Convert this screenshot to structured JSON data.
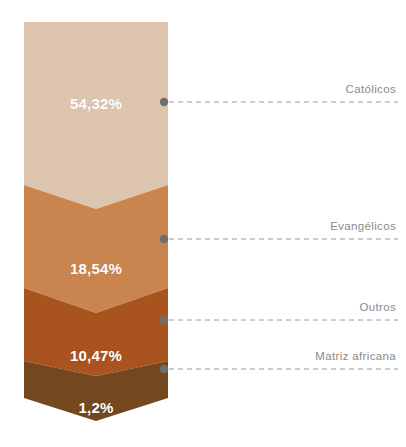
{
  "chart_data": {
    "type": "bar",
    "subtype": "funnel-chevron-stacked",
    "title": "",
    "xlabel": "",
    "ylabel": "",
    "unit": "%",
    "decimal_separator": ",",
    "background": "#ffffff",
    "categories": [
      "Católicos",
      "Evangélicos",
      "Outros",
      "Matriz africana"
    ],
    "values": [
      54.32,
      18.54,
      10.47,
      1.2
    ],
    "value_labels": [
      "54,32%",
      "18,54%",
      "10,47%",
      "1,2%"
    ],
    "colors": [
      "#ddc4ae",
      "#c8854f",
      "#a9531f",
      "#74481f"
    ],
    "label_color": "#8b8b8b",
    "value_text_color": "#ffffff",
    "connector_color": "#9a9a9a",
    "connector_dot_color": "#6e6e6e",
    "segments": [
      {
        "name": "Católicos",
        "value": 54.32,
        "value_label": "54,32%",
        "color": "#ddc4ae",
        "label": "Católicos",
        "value_x": 96,
        "value_y": 103,
        "dot_x": 164,
        "dot_y": 102,
        "line_end_x": 398,
        "label_x": 396,
        "label_y": 95
      },
      {
        "name": "Evangélicos",
        "value": 18.54,
        "value_label": "18,54%",
        "color": "#c8854f",
        "label": "Evangélicos",
        "value_x": 96,
        "value_y": 268,
        "dot_x": 164,
        "dot_y": 239,
        "line_end_x": 398,
        "label_x": 396,
        "label_y": 232
      },
      {
        "name": "Outros",
        "value": 10.47,
        "value_label": "10,47%",
        "color": "#a9531f",
        "label": "Outros",
        "value_x": 96,
        "value_y": 355,
        "dot_x": 164,
        "dot_y": 320,
        "line_end_x": 398,
        "label_x": 396,
        "label_y": 313
      },
      {
        "name": "Matriz africana",
        "value": 1.2,
        "value_label": "1,2%",
        "color": "#74481f",
        "label": "Matriz africana",
        "value_x": 96,
        "value_y": 407,
        "dot_x": 164,
        "dot_y": 369,
        "line_end_x": 398,
        "label_x": 396,
        "label_y": 362
      }
    ],
    "geometry": {
      "left": 24,
      "right": 168,
      "top": 22,
      "bottom_tip": 421,
      "chevron_boundaries": [
        {
          "shoulder_y": 185,
          "point_y": 209
        },
        {
          "shoulder_y": 288,
          "point_y": 313
        },
        {
          "shoulder_y": 361,
          "point_y": 376
        },
        {
          "shoulder_y": 398,
          "point_y": 421
        }
      ]
    },
    "grid": false,
    "legend": "none"
  }
}
